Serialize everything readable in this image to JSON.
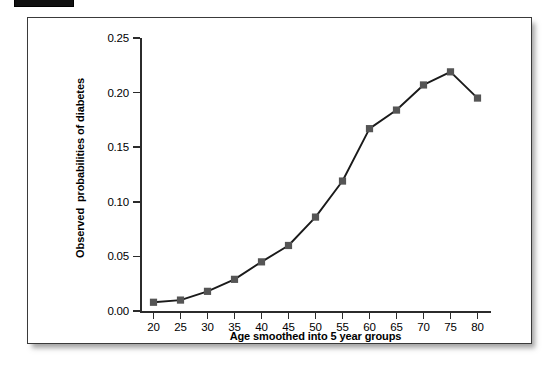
{
  "figure": {
    "artifact_label": "scan-bar"
  },
  "chart_data": {
    "type": "line",
    "title": "",
    "xlabel": "Age smoothed into 5 year groups",
    "ylabel": "Observed  probabilities of diabetes",
    "x": [
      20,
      25,
      30,
      35,
      40,
      45,
      50,
      55,
      60,
      65,
      70,
      75,
      80
    ],
    "values": [
      0.008,
      0.01,
      0.018,
      0.029,
      0.045,
      0.06,
      0.086,
      0.119,
      0.167,
      0.184,
      0.207,
      0.219,
      0.195
    ],
    "xtick_labels": [
      "20",
      "25",
      "30",
      "35",
      "40",
      "45",
      "50",
      "55",
      "60",
      "65",
      "70",
      "75",
      "80"
    ],
    "ytick_labels": [
      "0.00",
      "0.05",
      "0.10",
      "0.15",
      "0.20",
      "0.25"
    ],
    "yticks": [
      0.0,
      0.05,
      0.1,
      0.15,
      0.2,
      0.25
    ],
    "xlim": [
      17.5,
      82.5
    ],
    "ylim": [
      0.0,
      0.25
    ],
    "grid": false,
    "legend": false,
    "marker": "square",
    "marker_color": "#555555",
    "line_color": "#1a1a1a"
  }
}
